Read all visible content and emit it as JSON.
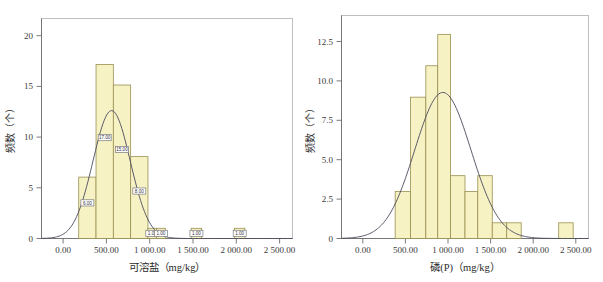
{
  "figure": {
    "title": "",
    "panel_count": 2
  },
  "chart_data": [
    {
      "type": "bar",
      "id": "soluble-salt-histogram",
      "title": "",
      "xlabel": "可溶盐（mg/kg）",
      "ylabel": "频数（个）",
      "xlim": [
        -250,
        2650
      ],
      "ylim": [
        0,
        21.5
      ],
      "xticks": [
        0,
        500,
        1000,
        1500,
        2000,
        2500
      ],
      "xticklabels": [
        "0.00",
        "500.00",
        "1 000.00",
        "1 500.00",
        "2 000.00",
        "2 500.00"
      ],
      "yticks": [
        0,
        5,
        10,
        15,
        20
      ],
      "yticklabels": [
        "0",
        "5",
        "10",
        "15",
        "20"
      ],
      "grid": false,
      "legend": null,
      "bin_width": 200,
      "bins": [
        {
          "x0": 180,
          "x1": 380,
          "value": 6,
          "label": "6.00"
        },
        {
          "x0": 380,
          "x1": 580,
          "value": 17,
          "label": "17.00"
        },
        {
          "x0": 580,
          "x1": 780,
          "value": 15,
          "label": "15.00"
        },
        {
          "x0": 780,
          "x1": 980,
          "value": 8,
          "label": "8.00"
        },
        {
          "x0": 980,
          "x1": 1080,
          "value": 1,
          "label": "1.00"
        },
        {
          "x0": 1080,
          "x1": 1180,
          "value": 1,
          "label": "1.00"
        },
        {
          "x0": 1480,
          "x1": 1600,
          "value": 1,
          "label": "1.00"
        },
        {
          "x0": 1980,
          "x1": 2100,
          "value": 1,
          "label": "1.00"
        }
      ],
      "normal_curve": {
        "mean": 560,
        "sigma": 215,
        "peak": 12.5
      }
    },
    {
      "type": "bar",
      "id": "phosphorus-histogram",
      "title": "",
      "xlabel": "磷(P)（mg/kg）",
      "ylabel": "频数（个）",
      "xlim": [
        -250,
        2650
      ],
      "ylim": [
        0,
        14.2
      ],
      "xticks": [
        0,
        500,
        1000,
        1500,
        2000,
        2500
      ],
      "xticklabels": [
        "0.00",
        "500.00",
        "1 000.00",
        "1 500.00",
        "2 000.00",
        "2 500.00"
      ],
      "yticks": [
        0,
        2.5,
        5.0,
        7.5,
        10.0,
        12.5
      ],
      "yticklabels": [
        "0",
        "2.5",
        "5.0",
        "7.5",
        "10.0",
        "12.5"
      ],
      "grid": false,
      "legend": null,
      "bin_width": 200,
      "bins": [
        {
          "x0": 380,
          "x1": 560,
          "value": 3,
          "label": ""
        },
        {
          "x0": 560,
          "x1": 740,
          "value": 9,
          "label": ""
        },
        {
          "x0": 740,
          "x1": 880,
          "value": 11,
          "label": ""
        },
        {
          "x0": 880,
          "x1": 1030,
          "value": 13,
          "label": ""
        },
        {
          "x0": 1030,
          "x1": 1200,
          "value": 4,
          "label": ""
        },
        {
          "x0": 1200,
          "x1": 1350,
          "value": 3,
          "label": ""
        },
        {
          "x0": 1350,
          "x1": 1520,
          "value": 4,
          "label": ""
        },
        {
          "x0": 1520,
          "x1": 1690,
          "value": 1,
          "label": ""
        },
        {
          "x0": 1690,
          "x1": 1860,
          "value": 1,
          "label": ""
        },
        {
          "x0": 2300,
          "x1": 2470,
          "value": 1,
          "label": ""
        }
      ],
      "normal_curve": {
        "mean": 940,
        "sigma": 330,
        "peak": 9.3
      }
    }
  ]
}
